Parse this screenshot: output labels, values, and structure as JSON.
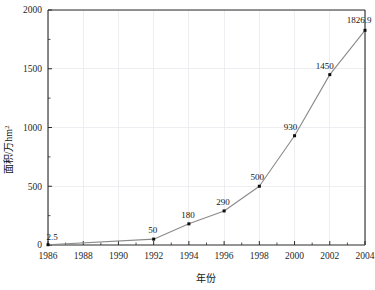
{
  "chart_data": {
    "type": "line",
    "title": "",
    "subtitle": "",
    "xlabel": "年份",
    "ylabel": "面积/万hm",
    "ylabel_superscript": "2",
    "x": [
      1986,
      1992,
      1994,
      1996,
      1998,
      2000,
      2002,
      2004
    ],
    "values": [
      2.5,
      50,
      180,
      290,
      500,
      930,
      1450,
      1826.9
    ],
    "point_labels": [
      "2.5",
      "50",
      "180",
      "290",
      "500",
      "930",
      "1450",
      "1826.9"
    ],
    "series": [
      {
        "name": "面积",
        "x": [
          1986,
          1992,
          1994,
          1996,
          1998,
          2000,
          2002,
          2004
        ],
        "values": [
          2.5,
          50,
          180,
          290,
          500,
          930,
          1450,
          1826.9
        ]
      }
    ],
    "xlim": [
      1986,
      2004
    ],
    "ylim": [
      0,
      2000
    ],
    "x_ticks": [
      1986,
      1988,
      1990,
      1992,
      1994,
      1996,
      1998,
      2000,
      2002,
      2004
    ],
    "x_tick_labels": [
      "1986",
      "1988",
      "1990",
      "1992",
      "1994",
      "1996",
      "1998",
      "2000",
      "2002",
      "2004"
    ],
    "x_minor_tick_step": 1,
    "y_ticks": [
      0,
      500,
      1000,
      1500,
      2000
    ],
    "y_tick_labels": [
      "0",
      "500",
      "1000",
      "1500",
      "2000"
    ],
    "y_minor_tick_step": 250,
    "grid": true,
    "grid_color": "#e7e7ec",
    "legend": "none",
    "line_color": "#8a8a8a",
    "marker_color": "#0d0d0d",
    "marker_shape": "square",
    "axis_color": "#2b2b2b",
    "background": "#ffffff"
  }
}
